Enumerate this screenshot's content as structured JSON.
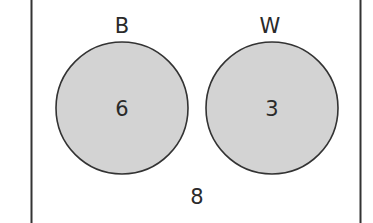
{
  "diagram": {
    "type": "venn",
    "universe": {
      "outside_count": "8"
    },
    "sets": [
      {
        "label": "B",
        "count": "6"
      },
      {
        "label": "W",
        "count": "3"
      }
    ],
    "overlap": "none",
    "colors": {
      "set_fill": "#d3d3d3",
      "stroke": "#333333",
      "background": "#ffffff"
    }
  }
}
